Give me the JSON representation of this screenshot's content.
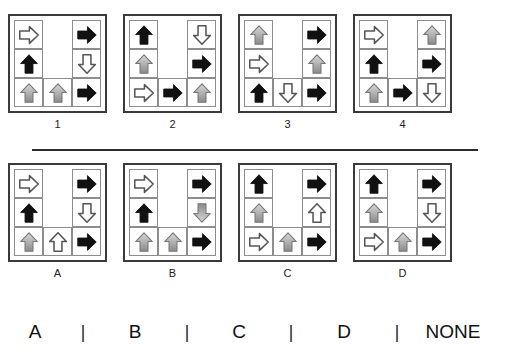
{
  "puzzle": {
    "type": "visual-analogy-matrix",
    "divider_label": "horizontal-rule",
    "arrow_styles": {
      "black": "#111111",
      "gray_top": "#d8d8d8",
      "gray_bottom": "#8a8a8a",
      "white_fill": "#ffffff",
      "outline": "#555555"
    },
    "question_panels": [
      {
        "label": "1",
        "cells": [
          {
            "style": "white",
            "dir": "right"
          },
          {
            "style": "none",
            "dir": "none"
          },
          {
            "style": "black",
            "dir": "right"
          },
          {
            "style": "black",
            "dir": "up"
          },
          {
            "style": "none",
            "dir": "none"
          },
          {
            "style": "white",
            "dir": "down"
          },
          {
            "style": "gray",
            "dir": "up"
          },
          {
            "style": "gray",
            "dir": "up"
          },
          {
            "style": "black",
            "dir": "right"
          }
        ]
      },
      {
        "label": "2",
        "cells": [
          {
            "style": "black",
            "dir": "up"
          },
          {
            "style": "none",
            "dir": "none"
          },
          {
            "style": "white",
            "dir": "down"
          },
          {
            "style": "gray",
            "dir": "up"
          },
          {
            "style": "none",
            "dir": "none"
          },
          {
            "style": "black",
            "dir": "right"
          },
          {
            "style": "white",
            "dir": "right"
          },
          {
            "style": "black",
            "dir": "right"
          },
          {
            "style": "gray",
            "dir": "up"
          }
        ]
      },
      {
        "label": "3",
        "cells": [
          {
            "style": "gray",
            "dir": "up"
          },
          {
            "style": "none",
            "dir": "none"
          },
          {
            "style": "black",
            "dir": "right"
          },
          {
            "style": "white",
            "dir": "right"
          },
          {
            "style": "none",
            "dir": "none"
          },
          {
            "style": "gray",
            "dir": "up"
          },
          {
            "style": "black",
            "dir": "up"
          },
          {
            "style": "white",
            "dir": "down"
          },
          {
            "style": "black",
            "dir": "right"
          }
        ]
      },
      {
        "label": "4",
        "cells": [
          {
            "style": "white",
            "dir": "right"
          },
          {
            "style": "none",
            "dir": "none"
          },
          {
            "style": "gray",
            "dir": "up"
          },
          {
            "style": "black",
            "dir": "up"
          },
          {
            "style": "none",
            "dir": "none"
          },
          {
            "style": "black",
            "dir": "right"
          },
          {
            "style": "gray",
            "dir": "up"
          },
          {
            "style": "black",
            "dir": "right"
          },
          {
            "style": "white",
            "dir": "down"
          }
        ]
      }
    ],
    "option_panels": [
      {
        "label": "A",
        "cells": [
          {
            "style": "white",
            "dir": "right"
          },
          {
            "style": "none",
            "dir": "none"
          },
          {
            "style": "black",
            "dir": "right"
          },
          {
            "style": "black",
            "dir": "up"
          },
          {
            "style": "none",
            "dir": "none"
          },
          {
            "style": "white",
            "dir": "down"
          },
          {
            "style": "gray",
            "dir": "up"
          },
          {
            "style": "white",
            "dir": "up"
          },
          {
            "style": "black",
            "dir": "right"
          }
        ]
      },
      {
        "label": "B",
        "cells": [
          {
            "style": "white",
            "dir": "right"
          },
          {
            "style": "none",
            "dir": "none"
          },
          {
            "style": "black",
            "dir": "right"
          },
          {
            "style": "black",
            "dir": "up"
          },
          {
            "style": "none",
            "dir": "none"
          },
          {
            "style": "gray",
            "dir": "down"
          },
          {
            "style": "gray",
            "dir": "up"
          },
          {
            "style": "gray",
            "dir": "up"
          },
          {
            "style": "black",
            "dir": "right"
          }
        ]
      },
      {
        "label": "C",
        "cells": [
          {
            "style": "black",
            "dir": "up"
          },
          {
            "style": "none",
            "dir": "none"
          },
          {
            "style": "black",
            "dir": "right"
          },
          {
            "style": "gray",
            "dir": "up"
          },
          {
            "style": "none",
            "dir": "none"
          },
          {
            "style": "white",
            "dir": "up"
          },
          {
            "style": "white",
            "dir": "right"
          },
          {
            "style": "gray",
            "dir": "up"
          },
          {
            "style": "black",
            "dir": "right"
          }
        ]
      },
      {
        "label": "D",
        "cells": [
          {
            "style": "black",
            "dir": "up"
          },
          {
            "style": "none",
            "dir": "none"
          },
          {
            "style": "black",
            "dir": "right"
          },
          {
            "style": "gray",
            "dir": "up"
          },
          {
            "style": "none",
            "dir": "none"
          },
          {
            "style": "white",
            "dir": "down"
          },
          {
            "style": "white",
            "dir": "right"
          },
          {
            "style": "gray",
            "dir": "up"
          },
          {
            "style": "black",
            "dir": "right"
          }
        ]
      }
    ]
  },
  "answer_bar": {
    "choices": [
      "A",
      "B",
      "C",
      "D",
      "NONE"
    ],
    "separator": "|"
  }
}
